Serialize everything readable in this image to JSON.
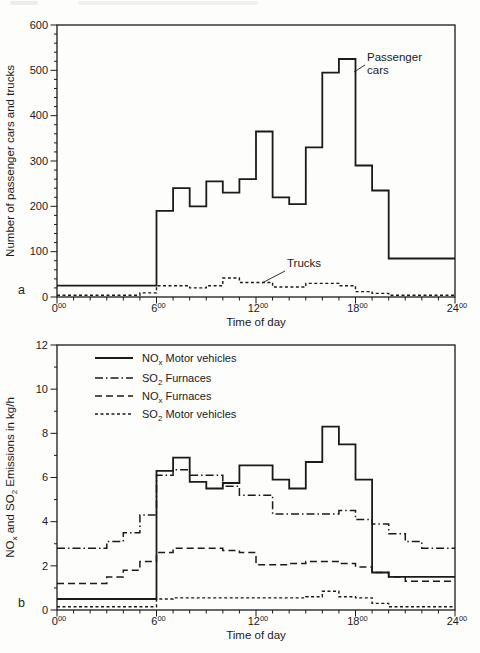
{
  "page": {
    "panel_a": "a",
    "panel_b": "b",
    "ink_color": "#1b1b1b"
  },
  "chart_data": [
    {
      "id": "chartA",
      "type": "line",
      "interpolation": "step",
      "title": "",
      "xlabel": "Time of day",
      "ylabel_parts": [
        [
          "Number of passenger cars and trucks",
          0
        ]
      ],
      "xlim": [
        0,
        24
      ],
      "ylim": [
        0,
        600
      ],
      "x_ticks": {
        "values": [
          0,
          6,
          12,
          18,
          24
        ],
        "sup": "00"
      },
      "y_ticks": [
        0,
        100,
        200,
        300,
        400,
        500,
        600
      ],
      "x_minor_step": 1,
      "y_minor_step": 20,
      "grid": false,
      "series": [
        {
          "name": "Passenger cars",
          "style": "solid",
          "points": [
            [
              0,
              25
            ],
            [
              6,
              190
            ],
            [
              7,
              240
            ],
            [
              8,
              200
            ],
            [
              9,
              255
            ],
            [
              10,
              230
            ],
            [
              11,
              260
            ],
            [
              12,
              365
            ],
            [
              13,
              220
            ],
            [
              14,
              205
            ],
            [
              15,
              330
            ],
            [
              16,
              495
            ],
            [
              17,
              525
            ],
            [
              18,
              290
            ],
            [
              19,
              235
            ],
            [
              20,
              85
            ],
            [
              24,
              85
            ]
          ]
        },
        {
          "name": "Trucks",
          "style": "shortdash",
          "points": [
            [
              0,
              4
            ],
            [
              5,
              9
            ],
            [
              6,
              25
            ],
            [
              8,
              20
            ],
            [
              9,
              25
            ],
            [
              10,
              42
            ],
            [
              11,
              32
            ],
            [
              13,
              22
            ],
            [
              15,
              30
            ],
            [
              17,
              25
            ],
            [
              18,
              12
            ],
            [
              19,
              8
            ],
            [
              20,
              4
            ],
            [
              24,
              4
            ]
          ]
        }
      ],
      "annotations": [
        {
          "name": "passenger-cars-label",
          "lines": [
            "Passenger",
            "cars"
          ],
          "tx": 367,
          "ty": 51,
          "leader": [
            365,
            65,
            354,
            72
          ]
        },
        {
          "name": "trucks-label",
          "lines": [
            "Trucks"
          ],
          "tx": 287,
          "ty": 257,
          "leader": [
            285,
            271,
            262,
            283
          ]
        }
      ]
    },
    {
      "id": "chartB",
      "type": "line",
      "interpolation": "step",
      "title": "",
      "xlabel": "Time of day",
      "ylabel_parts": [
        [
          "NO",
          0
        ],
        [
          "x",
          1
        ],
        [
          " and SO",
          0
        ],
        [
          "2",
          1
        ],
        [
          " Emissions in kg/h",
          0
        ]
      ],
      "xlim": [
        0,
        24
      ],
      "ylim": [
        0,
        12
      ],
      "x_ticks": {
        "values": [
          0,
          6,
          12,
          18,
          24
        ],
        "sup": "00"
      },
      "y_ticks": [
        0,
        2,
        4,
        6,
        8,
        10,
        12
      ],
      "x_minor_step": 1,
      "y_minor_step": 1,
      "grid": false,
      "legend": {
        "position": "top-left-inside",
        "items": [
          {
            "style": "solid",
            "parts": [
              [
                "NO",
                0
              ],
              [
                "x",
                1
              ],
              [
                " Motor vehicles",
                0
              ]
            ]
          },
          {
            "style": "dashdot",
            "parts": [
              [
                "SO",
                0
              ],
              [
                "2",
                1
              ],
              [
                " Furnaces",
                0
              ]
            ]
          },
          {
            "style": "dashed",
            "parts": [
              [
                "NO",
                0
              ],
              [
                "x",
                1
              ],
              [
                " Furnaces",
                0
              ]
            ]
          },
          {
            "style": "shortdash",
            "parts": [
              [
                "SO",
                0
              ],
              [
                "2",
                1
              ],
              [
                " Motor vehicles",
                0
              ]
            ]
          }
        ]
      },
      "series": [
        {
          "name": "NOx Motor vehicles",
          "style": "solid",
          "points": [
            [
              0,
              0.5
            ],
            [
              6,
              6.3
            ],
            [
              7,
              6.9
            ],
            [
              8,
              5.8
            ],
            [
              9,
              5.5
            ],
            [
              10,
              5.75
            ],
            [
              11,
              6.55
            ],
            [
              13,
              5.9
            ],
            [
              14,
              5.5
            ],
            [
              15,
              6.7
            ],
            [
              16,
              8.3
            ],
            [
              17,
              7.5
            ],
            [
              18,
              5.9
            ],
            [
              19,
              1.7
            ],
            [
              20,
              1.5
            ],
            [
              24,
              1.5
            ]
          ]
        },
        {
          "name": "SO2 Furnaces",
          "style": "dashdot",
          "points": [
            [
              0,
              2.8
            ],
            [
              3,
              3.1
            ],
            [
              4,
              3.5
            ],
            [
              5,
              4.3
            ],
            [
              6,
              6.1
            ],
            [
              7,
              6.35
            ],
            [
              8,
              6.1
            ],
            [
              10,
              5.6
            ],
            [
              11,
              5.2
            ],
            [
              13,
              4.35
            ],
            [
              17,
              4.5
            ],
            [
              18,
              4.1
            ],
            [
              19,
              3.9
            ],
            [
              20,
              3.45
            ],
            [
              21,
              3.1
            ],
            [
              22,
              2.8
            ],
            [
              24,
              2.8
            ]
          ]
        },
        {
          "name": "NOx Furnaces",
          "style": "dashed",
          "points": [
            [
              0,
              1.2
            ],
            [
              3,
              1.5
            ],
            [
              4,
              1.8
            ],
            [
              5,
              2.2
            ],
            [
              6,
              2.6
            ],
            [
              7,
              2.8
            ],
            [
              10,
              2.7
            ],
            [
              11,
              2.6
            ],
            [
              12,
              2.05
            ],
            [
              14,
              2.1
            ],
            [
              15,
              2.2
            ],
            [
              17,
              2.1
            ],
            [
              18,
              1.95
            ],
            [
              19,
              1.7
            ],
            [
              20,
              1.5
            ],
            [
              21,
              1.3
            ],
            [
              24,
              1.3
            ]
          ]
        },
        {
          "name": "SO2 Motor vehicles",
          "style": "shortdash",
          "points": [
            [
              0,
              0.15
            ],
            [
              6,
              0.5
            ],
            [
              7,
              0.55
            ],
            [
              15,
              0.6
            ],
            [
              16,
              0.85
            ],
            [
              17,
              0.6
            ],
            [
              18,
              0.55
            ],
            [
              19,
              0.3
            ],
            [
              20,
              0.15
            ],
            [
              24,
              0.15
            ]
          ]
        }
      ]
    }
  ]
}
